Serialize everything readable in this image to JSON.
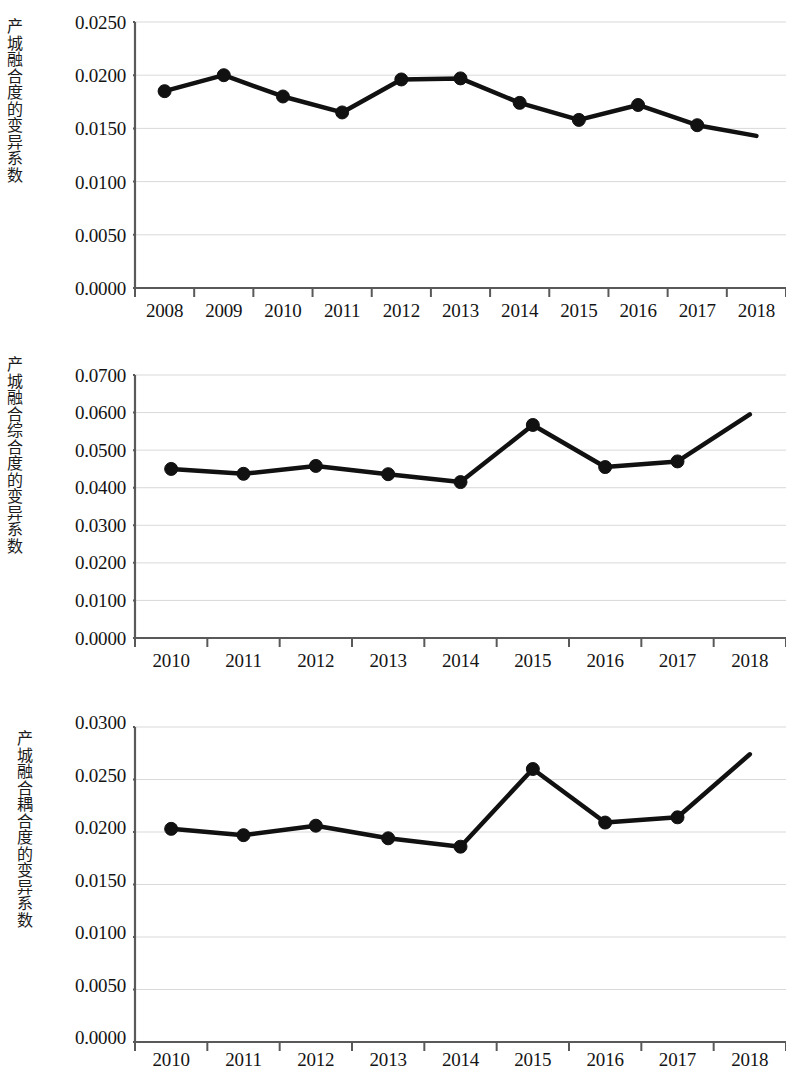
{
  "figure": {
    "background_color": "#ffffff",
    "line_color": "#111111",
    "grid_color": "#d9d9d9",
    "axis_color": "#595959"
  },
  "charts": [
    {
      "id": "chart-1",
      "axis_title": "产城融合度的变异系数",
      "ytick_labels": [
        "0.0250",
        "0.0200",
        "0.0150",
        "0.0100",
        "0.0050",
        "0.0000"
      ],
      "xtick_labels": [
        "2008",
        "2009",
        "2010",
        "2011",
        "2012",
        "2013",
        "2014",
        "2015",
        "2016",
        "2017",
        "2018"
      ],
      "chart_data": {
        "type": "line",
        "title": "",
        "xlabel": "",
        "ylabel": "产城融合度的变异系数",
        "categories": [
          "2008",
          "2009",
          "2010",
          "2011",
          "2012",
          "2013",
          "2014",
          "2015",
          "2016",
          "2017",
          "2018"
        ],
        "values": [
          0.0185,
          0.02,
          0.018,
          0.0165,
          0.0196,
          0.0197,
          0.0174,
          0.0158,
          0.0172,
          0.0153,
          0.0143
        ],
        "ylim": [
          0.0,
          0.025
        ],
        "ytick_step": 0.005,
        "grid": "horizontal",
        "legend": "none",
        "markers": true,
        "marker_shape": "circle"
      }
    },
    {
      "id": "chart-2",
      "axis_title": "产城融合综合度的变异系数",
      "ytick_labels": [
        "0.0700",
        "0.0600",
        "0.0500",
        "0.0400",
        "0.0300",
        "0.0200",
        "0.0100",
        "0.0000"
      ],
      "xtick_labels": [
        "2010",
        "2011",
        "2012",
        "2013",
        "2014",
        "2015",
        "2016",
        "2017",
        "2018"
      ],
      "chart_data": {
        "type": "line",
        "title": "",
        "xlabel": "",
        "ylabel": "产城融合综合度的变异系数",
        "categories": [
          "2010",
          "2011",
          "2012",
          "2013",
          "2014",
          "2015",
          "2016",
          "2017",
          "2018"
        ],
        "values": [
          0.045,
          0.0437,
          0.0458,
          0.0436,
          0.0415,
          0.0567,
          0.0455,
          0.047,
          0.0595
        ],
        "ylim": [
          0.0,
          0.07
        ],
        "ytick_step": 0.01,
        "grid": "horizontal",
        "legend": "none",
        "markers": true,
        "marker_shape": "circle"
      }
    },
    {
      "id": "chart-3",
      "axis_title": "产城融合耦合度的变异系数",
      "ytick_labels": [
        "0.0300",
        "0.0250",
        "0.0200",
        "0.0150",
        "0.0100",
        "0.0050",
        "0.0000"
      ],
      "xtick_labels": [
        "2010",
        "2011",
        "2012",
        "2013",
        "2014",
        "2015",
        "2016",
        "2017",
        "2018"
      ],
      "chart_data": {
        "type": "line",
        "title": "",
        "xlabel": "",
        "ylabel": "产城融合耦合度的变异系数",
        "categories": [
          "2010",
          "2011",
          "2012",
          "2013",
          "2014",
          "2015",
          "2016",
          "2017",
          "2018"
        ],
        "values": [
          0.0203,
          0.0197,
          0.0206,
          0.0194,
          0.0186,
          0.026,
          0.0209,
          0.0214,
          0.0274
        ],
        "ylim": [
          0.0,
          0.03
        ],
        "ytick_step": 0.005,
        "grid": "horizontal",
        "legend": "none",
        "markers": true,
        "marker_shape": "circle"
      }
    }
  ]
}
